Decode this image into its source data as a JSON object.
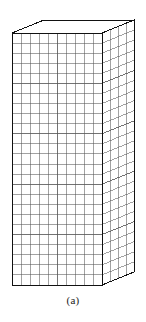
{
  "figure": {
    "caption": "(a)",
    "kind": "3d-hexahedral-mesh-block"
  },
  "chart_data": {
    "type": "diagram",
    "title": "(a)",
    "projection": "oblique",
    "geometry": {
      "front_face": {
        "columns": 10,
        "rows": 25,
        "corners_px": {
          "top_left": [
            12,
            33
          ],
          "top_right": [
            102,
            33
          ],
          "bottom_right": [
            102,
            285
          ],
          "bottom_left": [
            12,
            285
          ]
        }
      },
      "right_face": {
        "depth_divisions": 4,
        "rows": 25,
        "corners_px": {
          "front_top": [
            102,
            33
          ],
          "back_top": [
            134,
            20
          ],
          "back_bottom": [
            134,
            272
          ],
          "front_bottom": [
            102,
            285
          ]
        }
      },
      "top_face": {
        "grid": "none",
        "corners_px": {
          "front_left": [
            12,
            33
          ],
          "front_right": [
            102,
            33
          ],
          "back_right": [
            134,
            20
          ],
          "back_left": [
            44,
            20
          ]
        }
      },
      "depth_offset_px": [
        32,
        -13
      ]
    },
    "style": {
      "outline_color": "#111111",
      "grid_color": "#555555",
      "background": "#ffffff",
      "outline_width": 1.0,
      "grid_width": 0.55
    }
  },
  "colors": {
    "outline": "#111111",
    "grid": "#555555",
    "background": "#ffffff",
    "caption_text": "#1a1a1a"
  }
}
